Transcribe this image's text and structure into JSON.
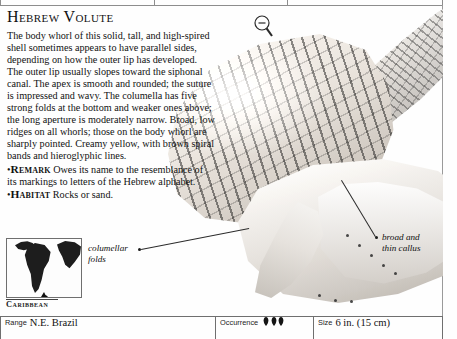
{
  "page": {
    "title": "Hebrew Volute",
    "description_paragraph": "The body whorl of this solid, tall, and high-spired shell sometimes appears to have parallel sides, depending on how the outer lip has developed. The outer lip usually slopes toward the siphonal canal. The apex is smooth and rounded; the suture is impressed and wavy. The columella has five strong folds at the bottom and weaker ones above; the long aperture is moderately narrow. Broad, low ridges on all whorls; those on the body whorl are sharply pointed. Creamy yellow, with brown spiral bands and hieroglyphic lines.",
    "remark_label": "Remark",
    "remark_text": "Owes its name to the resemblance of its markings to letters of the Hebrew alphabet.",
    "habitat_label": "Habitat",
    "habitat_text": "Rocks or sand.",
    "bullet": "•"
  },
  "callouts": [
    {
      "name": "columellar-folds",
      "line1": "columellar",
      "line2": "folds"
    },
    {
      "name": "broad-and-thin-callus",
      "line1": "broad and",
      "line2": "thin callus"
    }
  ],
  "map": {
    "label": "Caribbean",
    "region_icon": "south-america-map-icon"
  },
  "icons": {
    "magnifier": "magnifier-minus-icon",
    "occurrence_symbol": "shell-icon"
  },
  "footer": {
    "range_label": "Range",
    "range_value": "N.E. Brazil",
    "occurrence_label": "Occurrence",
    "occurrence_count": 3,
    "size_label": "Size",
    "size_value": "6 in. (15 cm)"
  },
  "colors": {
    "rule": "#6f6f6f",
    "text": "#111111",
    "ink": "#1b1b1b"
  }
}
